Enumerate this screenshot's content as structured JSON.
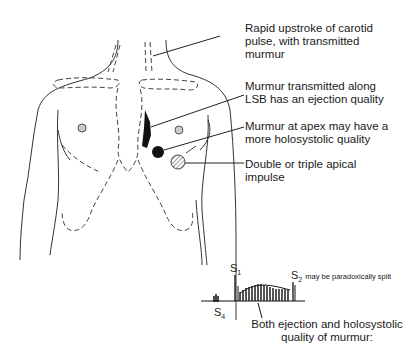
{
  "annotations": {
    "carotid": "Rapid upstroke of carotid pulse, with transmitted murmur",
    "lsb": "Murmur transmitted along LSB has an ejection quality",
    "apex": "Murmur at apex may have a more holosystolic quality",
    "impulse": "Double or triple apical impulse"
  },
  "phonocardiogram": {
    "s1_label": "S",
    "s1_sub": "1",
    "s2_label": "S",
    "s2_sub": "2",
    "s2_note": "may be paradoxically split",
    "s4_label": "S",
    "s4_sub": "4",
    "caption_line1": "Both ejection and holosystolic",
    "caption_line2": "quality of murmur:"
  }
}
